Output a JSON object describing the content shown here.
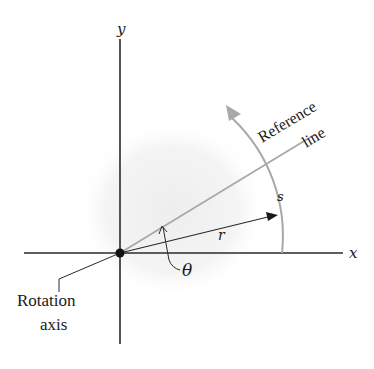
{
  "diagram": {
    "colors": {
      "axis": "#2a2a2a",
      "reference_line": "#a8a8a8",
      "arc": "#a8a8a8",
      "shaded_disk": "#f3f3f3",
      "text": "#1a1a1a"
    },
    "labels": {
      "y_axis": "y",
      "x_axis": "x",
      "reference_line_1": "Reference",
      "reference_line_2": "line",
      "arc_length": "s",
      "radius": "r",
      "angle": "θ",
      "rotation_axis_1": "Rotation",
      "rotation_axis_2": "axis"
    },
    "geometry": {
      "origin": [
        120,
        253
      ],
      "radius_px": 160,
      "reference_angle_deg": 30,
      "r_vector_angle_deg": 14
    }
  }
}
